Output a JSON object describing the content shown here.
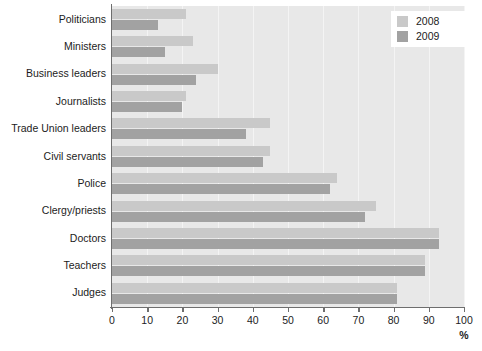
{
  "chart_data": {
    "type": "bar",
    "orientation": "horizontal",
    "title": "",
    "xlabel": "%",
    "ylabel": "",
    "xlim": [
      0,
      100
    ],
    "xticks": [
      0,
      10,
      20,
      30,
      40,
      50,
      60,
      70,
      80,
      90,
      100
    ],
    "grid": true,
    "legend_position": "top-right",
    "categories": [
      "Politicians",
      "Ministers",
      "Business leaders",
      "Journalists",
      "Trade Union leaders",
      "Civil servants",
      "Police",
      "Clergy/priests",
      "Doctors",
      "Teachers",
      "Judges"
    ],
    "series": [
      {
        "name": "2008",
        "color": "#c9c9c9",
        "values": [
          21,
          23,
          30,
          21,
          45,
          45,
          64,
          75,
          93,
          89,
          81
        ]
      },
      {
        "name": "2009",
        "color": "#a2a2a2",
        "values": [
          13,
          15,
          24,
          20,
          38,
          43,
          62,
          72,
          93,
          89,
          81
        ]
      }
    ]
  },
  "legend": {
    "entries": [
      {
        "label": "2008",
        "color": "#c9c9c9"
      },
      {
        "label": "2009",
        "color": "#a2a2a2"
      }
    ]
  },
  "axis": {
    "unit": "%",
    "tick_labels": [
      "0",
      "10",
      "20",
      "30",
      "40",
      "50",
      "60",
      "70",
      "80",
      "90",
      "100"
    ]
  },
  "colors": {
    "plot_background": "#e8e8e8",
    "gridline": "#f4f4f4",
    "axis": "#6e6e6e",
    "text": "#1c1c1c",
    "page_background": "#ffffff"
  }
}
